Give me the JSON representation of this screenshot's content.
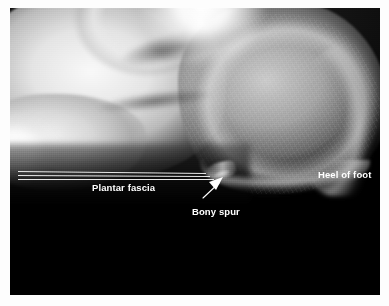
{
  "figure": {
    "kind": "annotated-radiograph",
    "width": 389,
    "height": 306,
    "background_color": "#ffffff",
    "plate_color": "#000000"
  },
  "annotations": {
    "plantar_fascia": {
      "label": "Plantar fascia",
      "color": "#ffffff",
      "marker": "parallel-lines",
      "line_color": "#e9e9e9",
      "line_count": 3
    },
    "bony_spur": {
      "label": "Bony spur",
      "color": "#ffffff",
      "marker": "arrow",
      "arrow_color": "#ffffff"
    },
    "heel_of_foot": {
      "label": "Heel of foot",
      "color": "#ffffff",
      "marker": "none"
    }
  }
}
